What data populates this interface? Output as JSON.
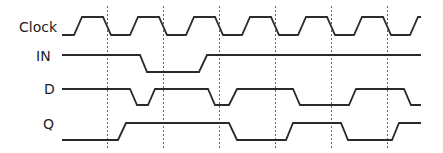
{
  "diagram": {
    "type": "timing-diagram",
    "colors": {
      "wave": "#2a2a2a",
      "guide": "#666666",
      "label": "#222222"
    },
    "clock_edge_guides_x": [
      107,
      163,
      219,
      275,
      331,
      387
    ],
    "signals": [
      {
        "id": "clock",
        "label": "Clock",
        "label_pos": [
          19,
          20
        ],
        "levels": {
          "high": 17,
          "low": 35
        },
        "points": [
          [
            62,
            35
          ],
          [
            74,
            35
          ],
          [
            82,
            17
          ],
          [
            103,
            17
          ],
          [
            111,
            35
          ],
          [
            130,
            35
          ],
          [
            138,
            17
          ],
          [
            159,
            17
          ],
          [
            167,
            35
          ],
          [
            186,
            35
          ],
          [
            194,
            17
          ],
          [
            215,
            17
          ],
          [
            223,
            35
          ],
          [
            242,
            35
          ],
          [
            250,
            17
          ],
          [
            271,
            17
          ],
          [
            279,
            35
          ],
          [
            298,
            35
          ],
          [
            306,
            17
          ],
          [
            327,
            17
          ],
          [
            335,
            35
          ],
          [
            354,
            35
          ],
          [
            362,
            17
          ],
          [
            383,
            17
          ],
          [
            391,
            35
          ],
          [
            410,
            35
          ],
          [
            418,
            17
          ],
          [
            421,
            17
          ]
        ]
      },
      {
        "id": "in",
        "label": "IN",
        "label_pos": [
          36,
          49
        ],
        "levels": {
          "high": 55,
          "low": 72
        },
        "points": [
          [
            62,
            55
          ],
          [
            140,
            55
          ],
          [
            147,
            72
          ],
          [
            199,
            72
          ],
          [
            207,
            55
          ],
          [
            421,
            55
          ]
        ]
      },
      {
        "id": "d",
        "label": "D",
        "label_pos": [
          44,
          82
        ],
        "levels": {
          "high": 89,
          "low": 105
        },
        "points": [
          [
            62,
            89
          ],
          [
            130,
            89
          ],
          [
            137,
            105
          ],
          [
            148,
            105
          ],
          [
            155,
            89
          ],
          [
            208,
            89
          ],
          [
            215,
            105
          ],
          [
            229,
            105
          ],
          [
            237,
            89
          ],
          [
            293,
            89
          ],
          [
            300,
            105
          ],
          [
            349,
            105
          ],
          [
            356,
            89
          ],
          [
            404,
            89
          ],
          [
            411,
            105
          ],
          [
            421,
            105
          ]
        ]
      },
      {
        "id": "q",
        "label": "Q",
        "label_pos": [
          43,
          117
        ],
        "levels": {
          "high": 123,
          "low": 140
        },
        "points": [
          [
            62,
            140
          ],
          [
            118,
            140
          ],
          [
            126,
            123
          ],
          [
            229,
            123
          ],
          [
            237,
            140
          ],
          [
            286,
            140
          ],
          [
            293,
            123
          ],
          [
            341,
            123
          ],
          [
            348,
            140
          ],
          [
            392,
            140
          ],
          [
            399,
            123
          ],
          [
            421,
            123
          ]
        ]
      }
    ]
  }
}
